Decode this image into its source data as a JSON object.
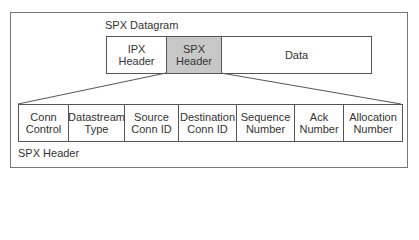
{
  "diagram": {
    "datagram_label": "SPX Datagram",
    "datagram_cells": [
      {
        "label": "IPX\nHeader",
        "width": 60,
        "highlight": false
      },
      {
        "label": "SPX\nHeader",
        "width": 55,
        "highlight": true
      },
      {
        "label": "Data",
        "width": 149,
        "highlight": false
      }
    ],
    "header_label": "SPX Header",
    "header_cells": [
      {
        "label": "Conn\nControl",
        "width": 50
      },
      {
        "label": "Datastream\nType",
        "width": 56
      },
      {
        "label": "Source\nConn ID",
        "width": 54
      },
      {
        "label": "Destination\nConn ID",
        "width": 58
      },
      {
        "label": "Sequence\nNumber",
        "width": 58
      },
      {
        "label": "Ack\nNumber",
        "width": 49
      },
      {
        "label": "Allocation\nNumber",
        "width": 58
      }
    ],
    "colors": {
      "highlight": "#c8c8c8",
      "line": "#555555"
    }
  }
}
